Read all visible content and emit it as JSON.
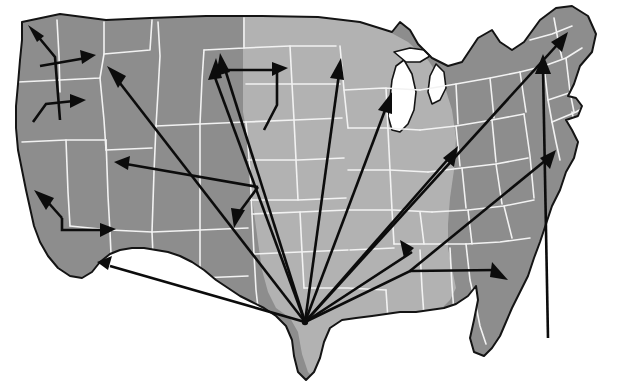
{
  "figure": {
    "title": "United States migration flow map",
    "background_color": "#ffffff",
    "outline_color": "#141414",
    "arrow_color": "#0c0c0c",
    "state_border_color": "#f2f2f2",
    "shading": {
      "dark_region_color": "#8d8d8d",
      "light_region_color": "#b2b2b2",
      "dark_region_label": "outer states",
      "light_region_label": "central corridor states"
    },
    "canvas": {
      "width": 624,
      "height": 389
    }
  },
  "hubs": [
    {
      "name": "primary-hub-south-texas",
      "x": 305,
      "y": 322,
      "label": "South Texas origin hub"
    },
    {
      "name": "branch-node-north-california",
      "x": 33,
      "y": 122,
      "label": "Northern California branch node"
    },
    {
      "name": "branch-node-nevada",
      "x": 62,
      "y": 218,
      "label": "Nevada branch node"
    },
    {
      "name": "branch-node-colorado",
      "x": 258,
      "y": 187,
      "label": "Colorado branch node"
    },
    {
      "name": "branch-node-dakota",
      "x": 277,
      "y": 105,
      "label": "Northern plains branch node"
    },
    {
      "name": "branch-node-alabama",
      "x": 410,
      "y": 271,
      "label": "Alabama branch node"
    },
    {
      "name": "branch-node-puget",
      "x": 55,
      "y": 57,
      "label": "Puget Sound branch node"
    }
  ],
  "arrows": [
    {
      "id": "arrow-to-washington-north",
      "from": "puget-branch",
      "to": "Washington (north)",
      "head_x": 30,
      "head_y": 28,
      "angle_deg": 212
    },
    {
      "id": "arrow-to-washington-east",
      "from": "puget-branch",
      "to": "Washington (east)",
      "head_x": 88,
      "head_y": 56,
      "angle_deg": 328
    },
    {
      "id": "arrow-to-idaho",
      "from": "south-texas-hub",
      "to": "Idaho / eastern Oregon",
      "head_x": 112,
      "head_y": 75,
      "angle_deg": 323
    },
    {
      "id": "arrow-to-oregon",
      "from": "north-california-branch",
      "to": "Oregon",
      "head_x": 76,
      "head_y": 120,
      "angle_deg": 0
    },
    {
      "id": "arrow-to-utah-nevada",
      "from": "colorado-branch",
      "to": "Utah / Nevada",
      "head_x": 120,
      "head_y": 145,
      "angle_deg": 193
    },
    {
      "id": "arrow-to-montana",
      "from": "south-texas-hub",
      "to": "Montana / Wyoming",
      "head_x": 219,
      "head_y": 57,
      "angle_deg": 295
    },
    {
      "id": "arrow-to-north-dakota",
      "from": "dakota-branch",
      "to": "North Dakota",
      "head_x": 288,
      "head_y": 68,
      "angle_deg": 0
    },
    {
      "id": "arrow-to-minnesota",
      "from": "south-texas-hub",
      "to": "Minnesota",
      "head_x": 334,
      "head_y": 56,
      "angle_deg": 299
    },
    {
      "id": "arrow-to-iowa",
      "from": "south-texas-hub",
      "to": "Iowa / Wisconsin",
      "head_x": 342,
      "head_y": 78,
      "angle_deg": 285
    },
    {
      "id": "arrow-to-michigan",
      "from": "south-texas-hub",
      "to": "Michigan",
      "head_x": 389,
      "head_y": 95,
      "angle_deg": 290
    },
    {
      "id": "arrow-to-colorado-south",
      "from": "colorado-branch",
      "to": "Colorado (south)",
      "head_x": 237,
      "head_y": 225,
      "angle_deg": 90
    },
    {
      "id": "arrow-to-northern-california",
      "from": "nevada-branch",
      "to": "Northern California coast",
      "head_x": 38,
      "head_y": 208,
      "angle_deg": 215
    },
    {
      "id": "arrow-to-nevada-east",
      "from": "nevada-branch",
      "to": "Nevada (east)",
      "head_x": 112,
      "head_y": 226,
      "angle_deg": 0
    },
    {
      "id": "arrow-to-southern-california",
      "from": "south-texas-hub",
      "to": "Southern California",
      "head_x": 100,
      "head_y": 260,
      "angle_deg": 205
    },
    {
      "id": "arrow-to-tennessee",
      "from": "alabama-branch",
      "to": "Tennessee",
      "head_x": 404,
      "head_y": 243,
      "angle_deg": 215
    },
    {
      "id": "arrow-to-ohio",
      "from": "south-texas-hub",
      "to": "Ohio / West Virginia",
      "head_x": 452,
      "head_y": 148,
      "angle_deg": 292
    },
    {
      "id": "arrow-to-new-england",
      "from": "south-texas-hub",
      "to": "New England",
      "head_x": 562,
      "head_y": 35,
      "angle_deg": 305
    },
    {
      "id": "arrow-to-pennsylvania",
      "from": "florida-origin",
      "to": "Pennsylvania / New York",
      "head_x": 545,
      "head_y": 57,
      "angle_deg": 300
    },
    {
      "id": "arrow-to-virginia",
      "from": "south-texas-hub",
      "to": "Virginia / Carolinas",
      "head_x": 549,
      "head_y": 150,
      "angle_deg": 296
    },
    {
      "id": "arrow-to-florida",
      "from": "alabama-branch",
      "to": "Florida panhandle",
      "head_x": 506,
      "head_y": 278,
      "angle_deg": 60
    }
  ],
  "regions": {
    "light_states": [
      "North Dakota",
      "South Dakota",
      "Nebraska",
      "Kansas",
      "Oklahoma",
      "Texas",
      "Minnesota",
      "Iowa",
      "Missouri",
      "Arkansas",
      "Louisiana",
      "Wisconsin",
      "Illinois",
      "Mississippi"
    ],
    "dark_states": [
      "Washington",
      "Oregon",
      "California",
      "Idaho",
      "Nevada",
      "Utah",
      "Arizona",
      "Montana",
      "Wyoming",
      "Colorado",
      "New Mexico",
      "Michigan",
      "Indiana",
      "Ohio",
      "Kentucky",
      "Tennessee",
      "Alabama",
      "Georgia",
      "Florida",
      "South Carolina",
      "North Carolina",
      "Virginia",
      "West Virginia",
      "Maryland",
      "Pennsylvania",
      "New York",
      "New Jersey",
      "Maine",
      "New Hampshire",
      "Vermont",
      "Massachusetts",
      "Connecticut",
      "Rhode Island",
      "Delaware"
    ]
  }
}
